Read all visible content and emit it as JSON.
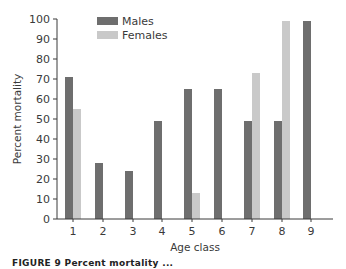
{
  "chart_data": {
    "type": "bar",
    "title": "",
    "xlabel": "Age class",
    "ylabel": "Percent mortality",
    "categories": [
      "1",
      "2",
      "3",
      "4",
      "5",
      "6",
      "7",
      "8",
      "9"
    ],
    "series": [
      {
        "name": "Males",
        "color": "#6e6e6e",
        "values": [
          71,
          28,
          24,
          49,
          65,
          65,
          49,
          49,
          99
        ]
      },
      {
        "name": "Females",
        "color": "#c9c9c9",
        "values": [
          55,
          0,
          0,
          0,
          13,
          0,
          73,
          99,
          0
        ]
      }
    ],
    "ylim": [
      0,
      100
    ],
    "yticks": [
      0,
      10,
      20,
      30,
      40,
      50,
      60,
      70,
      80,
      90,
      100
    ],
    "grid": false,
    "legend_position": "upper-left-inside"
  },
  "caption": "FIGURE 9  Percent mortality ..."
}
